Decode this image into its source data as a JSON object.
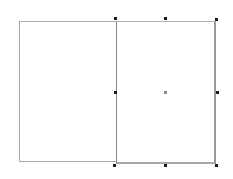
{
  "canvas": {
    "background": "#ffffff",
    "shapes": [
      {
        "id": "left-rectangle",
        "type": "rectangle",
        "x": 19,
        "y": 21,
        "width": 97,
        "height": 141,
        "stroke": "#a8a8a8",
        "selected": false
      },
      {
        "id": "right-rectangle",
        "type": "rectangle",
        "x": 116,
        "y": 21,
        "width": 100,
        "height": 143,
        "stroke": "#9a9a9a",
        "selected": true
      }
    ],
    "selection": {
      "handle_color": "#1a1a1a",
      "center_color": "#8c8c8c",
      "handles": [
        {
          "name": "top-left",
          "x": 114,
          "y": 17
        },
        {
          "name": "top-center",
          "x": 164,
          "y": 17
        },
        {
          "name": "top-right",
          "x": 215,
          "y": 18
        },
        {
          "name": "middle-left",
          "x": 114,
          "y": 91
        },
        {
          "name": "middle-right",
          "x": 216,
          "y": 91
        },
        {
          "name": "bottom-left",
          "x": 113,
          "y": 164
        },
        {
          "name": "bottom-center",
          "x": 164,
          "y": 164
        },
        {
          "name": "bottom-right",
          "x": 215,
          "y": 164
        }
      ],
      "center": {
        "x": 164,
        "y": 91
      }
    }
  }
}
